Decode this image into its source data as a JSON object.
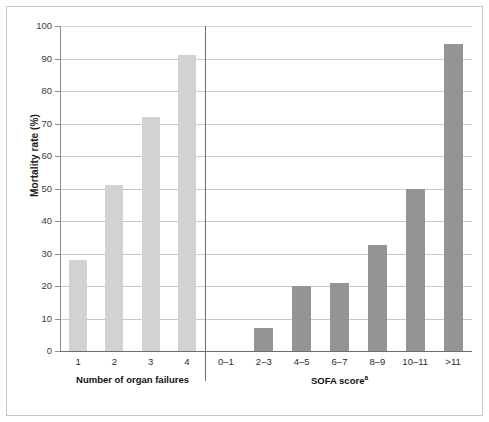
{
  "chart_data": {
    "type": "bar",
    "title": "",
    "xlabel": "",
    "ylabel": "Mortality rate (%)",
    "ylim": [
      0,
      100
    ],
    "yticks": [
      0,
      10,
      20,
      30,
      40,
      50,
      60,
      70,
      80,
      90,
      100
    ],
    "grid": true,
    "legend": "none",
    "panels": [
      {
        "name": "organ-failures",
        "group_label": "Number of organ failures",
        "group_label_superscript": "",
        "bar_color": "#d2d2d2",
        "categories": [
          "1",
          "2",
          "3",
          "4"
        ],
        "values": [
          28,
          51,
          72,
          91
        ]
      },
      {
        "name": "sofa-score",
        "group_label": "SOFA score",
        "group_label_superscript": "a",
        "bar_color": "#949494",
        "categories": [
          "0–1",
          "2–3",
          "4–5",
          "6–7",
          "8–9",
          "10–11",
          ">11"
        ],
        "values": [
          0,
          7,
          20,
          21,
          32.5,
          50,
          94.5
        ]
      }
    ]
  },
  "colors": {
    "bar_light": "#d2d2d2",
    "bar_dark": "#949494",
    "gridline": "#9a9a9a",
    "axis": "#6e6e6e",
    "frame": "#c8c8c8",
    "text": "#2b2b2b"
  }
}
